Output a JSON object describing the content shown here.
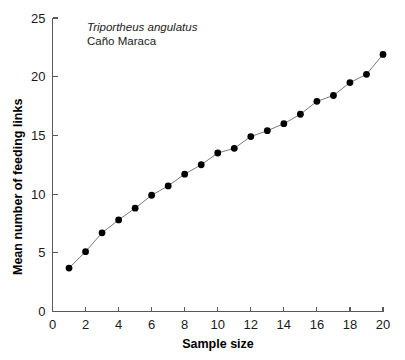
{
  "chart_data": {
    "type": "line",
    "title": "",
    "subtitle": "",
    "xlabel": "Sample size",
    "ylabel": "Mean number of feeding links",
    "xlim": [
      0,
      20
    ],
    "ylim": [
      0,
      25
    ],
    "xticks": [
      0,
      2,
      4,
      6,
      8,
      10,
      12,
      14,
      16,
      18,
      20
    ],
    "xtick_labels": [
      "0",
      "2",
      "4",
      "6",
      "8",
      "10",
      "12",
      "14",
      "16",
      "18",
      "20"
    ],
    "yticks": [
      0,
      5,
      10,
      15,
      20,
      25
    ],
    "ytick_labels": [
      "0",
      "5",
      "10",
      "15",
      "20",
      "25"
    ],
    "grid": false,
    "legend": false,
    "legend_position": "none",
    "marker": "filled-circle",
    "marker_color": "#000000",
    "line_color": "#6b6b6b",
    "axis_color": "#5a5a5a",
    "x": [
      1,
      2,
      3,
      4,
      5,
      6,
      7,
      8,
      9,
      10,
      11,
      12,
      13,
      14,
      15,
      16,
      17,
      18,
      19,
      20
    ],
    "values": [
      3.7,
      5.1,
      6.7,
      7.8,
      8.8,
      9.9,
      10.7,
      11.7,
      12.5,
      13.5,
      13.9,
      14.9,
      15.4,
      16.0,
      16.8,
      17.9,
      18.4,
      19.5,
      20.2,
      21.9
    ],
    "series": [
      {
        "name": "Triportheus angulatus - Cano Maraca",
        "x": [
          1,
          2,
          3,
          4,
          5,
          6,
          7,
          8,
          9,
          10,
          11,
          12,
          13,
          14,
          15,
          16,
          17,
          18,
          19,
          20
        ],
        "values": [
          3.7,
          5.1,
          6.7,
          7.8,
          8.8,
          9.9,
          10.7,
          11.7,
          12.5,
          13.5,
          13.9,
          14.9,
          15.4,
          16.0,
          16.8,
          17.9,
          18.4,
          19.5,
          20.2,
          21.9
        ]
      }
    ],
    "annotations": [
      {
        "text": "Triportheus angulatus",
        "style": "italic"
      },
      {
        "text": "Caño Maraca",
        "style": "normal"
      }
    ]
  }
}
